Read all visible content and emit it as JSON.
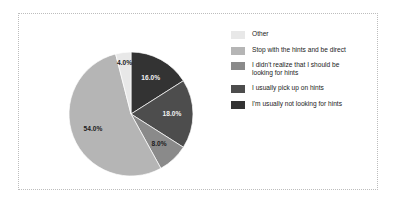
{
  "chart_data": {
    "type": "pie",
    "title": "",
    "categories": [
      "Other",
      "Stop with the hints and be direct",
      "I didn't realize that I should be\nlooking for hints",
      "I usually pick up on hints",
      "I'm usually not looking for hints"
    ],
    "values": [
      4.0,
      54.0,
      8.0,
      18.0,
      16.0
    ],
    "value_labels": [
      "4.0%",
      "54.0%",
      "8.0%",
      "18.0%",
      "16.0%"
    ],
    "colors": [
      "#e8e8e8",
      "#b5b5b5",
      "#8a8a8a",
      "#4d4d4d",
      "#333333"
    ],
    "legend_position": "right",
    "grid": false,
    "start_angle_deg": 0,
    "direction": "clockwise",
    "slice_order_clockwise_from_top": [
      {
        "label": "I'm usually not looking for hints",
        "value": 16.0,
        "display": "16.0%",
        "color": "#333333",
        "label_fill": "on-dark"
      },
      {
        "label": "I usually pick up on hints",
        "value": 18.0,
        "display": "18.0%",
        "color": "#4d4d4d",
        "label_fill": "on-dark"
      },
      {
        "label": "I didn't realize that I should be looking for hints",
        "value": 8.0,
        "display": "8.0%",
        "color": "#8a8a8a",
        "label_fill": "on-light"
      },
      {
        "label": "Stop with the hints and be direct",
        "value": 54.0,
        "display": "54.0%",
        "color": "#b5b5b5",
        "label_fill": "on-light"
      },
      {
        "label": "Other",
        "value": 4.0,
        "display": "4.0%",
        "color": "#e8e8e8",
        "label_fill": "on-light"
      }
    ]
  },
  "legend": {
    "items": [
      {
        "label": "Other",
        "color": "#e8e8e8"
      },
      {
        "label": "Stop with the hints and be direct",
        "color": "#b5b5b5"
      },
      {
        "label": "I didn't realize that I should be\nlooking for hints",
        "color": "#8a8a8a"
      },
      {
        "label": "I usually pick up on hints",
        "color": "#4d4d4d"
      },
      {
        "label": "I'm usually not looking for hints",
        "color": "#333333"
      }
    ]
  },
  "frame": {
    "border_color": "#bdbdbd",
    "background": "#ffffff"
  }
}
